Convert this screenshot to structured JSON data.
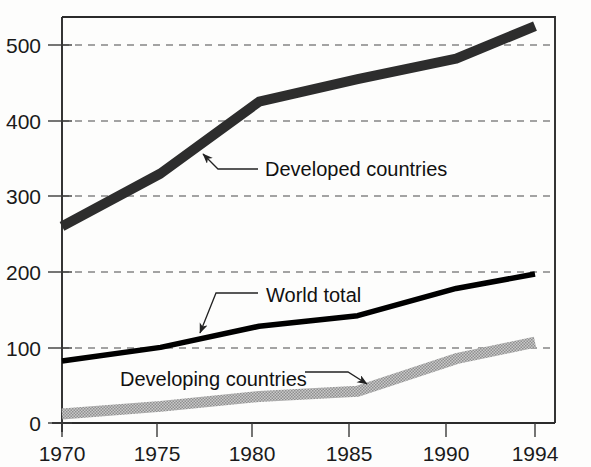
{
  "chart_data": {
    "type": "line",
    "title": "",
    "subtitle": "",
    "xlabel": "",
    "ylabel": "",
    "x": [
      1970,
      1975,
      1980,
      1985,
      1990,
      1994
    ],
    "xlim": [
      1970,
      1994
    ],
    "ylim": [
      0,
      540
    ],
    "grid": true,
    "legend_position": "inline-annotations",
    "xticks": [
      "1970",
      "1975",
      "1980",
      "1985",
      "1990",
      "1994"
    ],
    "yticks": [
      "0",
      "100",
      "200",
      "300",
      "400",
      "500"
    ],
    "ytick_values": [
      0,
      100,
      200,
      300,
      400,
      500
    ],
    "series": [
      {
        "name": "Developed countries",
        "color": "#2d2d2d",
        "style": "thick-dark-band",
        "values": [
          260,
          330,
          425,
          455,
          482,
          525
        ]
      },
      {
        "name": "World total",
        "color": "#000000",
        "style": "solid-black",
        "values": [
          82,
          100,
          128,
          142,
          178,
          197
        ]
      },
      {
        "name": "Developing countries",
        "color": "#a8a8a8",
        "style": "grey-hatched-band",
        "values": [
          12,
          22,
          35,
          42,
          85,
          107
        ]
      }
    ],
    "annotations": [
      {
        "name": "developed-countries-annotation",
        "label": "Developed countries",
        "label_x": 265,
        "label_y": 176,
        "leader_from_x": 258,
        "leader_from_y": 169,
        "leader_mid_x": 218,
        "leader_mid_y": 169,
        "arrow_x": 201,
        "arrow_y": 152
      },
      {
        "name": "world-total-annotation",
        "label": "World total",
        "label_x": 266,
        "label_y": 302,
        "leader_from_x": 258,
        "leader_from_y": 293,
        "leader_mid_x": 216,
        "leader_mid_y": 293,
        "arrow_x": 198,
        "arrow_y": 336
      },
      {
        "name": "developing-countries-annotation",
        "label": "Developing countries",
        "label_x": 120,
        "label_y": 386,
        "leader_from_x": 305,
        "leader_from_y": 372,
        "leader_mid_x": 348,
        "leader_mid_y": 372,
        "arrow_x": 370,
        "arrow_y": 387
      }
    ]
  },
  "colors": {
    "background": "#fdfdfc",
    "axis": "#2b2b2b",
    "grid": "#4a4a4a",
    "developed": "#2d2d2d",
    "world_total": "#000000",
    "developing": "#a8a8a8"
  }
}
